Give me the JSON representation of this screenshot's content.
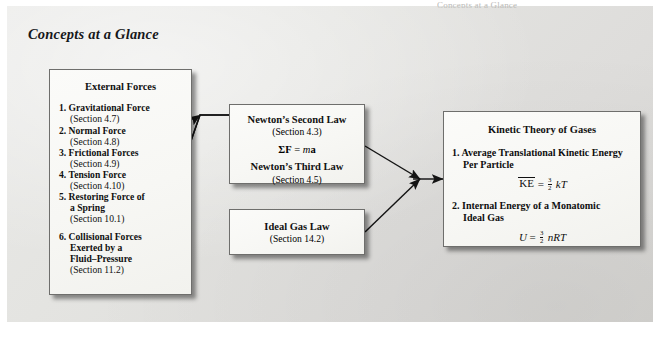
{
  "figure": {
    "title": "Concepts at a Glance",
    "cutoff_top_text": "Concepts at a Glance"
  },
  "boxes": {
    "external_forces": {
      "title": "External Forces",
      "items": [
        {
          "num": "1.",
          "name": "Gravitational Force",
          "section": "(Section 4.7)"
        },
        {
          "num": "2.",
          "name": "Normal Force",
          "section": "(Section 4.8)"
        },
        {
          "num": "3.",
          "name": "Frictional Forces",
          "section": "(Section 4.9)"
        },
        {
          "num": "4.",
          "name": "Tension Force",
          "section": "(Section 4.10)"
        },
        {
          "num": "5.",
          "name": "Restoring Force of",
          "cont": "a Spring",
          "section": "(Section 10.1)"
        },
        {
          "num": "6.",
          "name": "Collisional Forces",
          "cont": "Exerted by a",
          "cont2": "Fluid–Pressure",
          "section": "(Section 11.2)"
        }
      ]
    },
    "newton_laws": {
      "title": "Newton’s Second Law",
      "section": "(Section 4.3)",
      "equation": "ΣF = ma",
      "title2": "Newton’s Third Law",
      "section2": "(Section 4.5)"
    },
    "ideal_gas": {
      "title": "Ideal Gas Law",
      "section": "(Section 14.2)"
    },
    "kinetic_theory": {
      "title": "Kinetic Theory of Gases",
      "items": [
        {
          "num": "1.",
          "name": "Average Translational Kinetic Energy",
          "cont": "Per Particle",
          "equation": "KE = 3/2 kT"
        },
        {
          "num": "2.",
          "name": "Internal Energy of a Monatomic",
          "cont": "Ideal Gas",
          "equation": "U = 3/2 nRT"
        }
      ]
    }
  },
  "connectors": [
    {
      "from": "external_forces",
      "to": "newton_laws"
    },
    {
      "from": "newton_laws",
      "to": "kinetic_theory"
    },
    {
      "from": "ideal_gas",
      "to": "kinetic_theory"
    }
  ],
  "colors": {
    "panel_background": "#e4e4e1",
    "box_background": "#f8f8f5",
    "box_border": "#6e6e6c",
    "text": "#111111",
    "connector": "#1a1a1a"
  }
}
